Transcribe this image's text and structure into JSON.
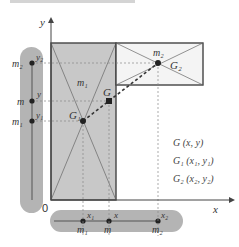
{
  "diagram": {
    "axes": {
      "x_label": "x",
      "y_label": "y",
      "origin_label": "0"
    },
    "bodies": [
      {
        "id": "body1",
        "mass_label": "m₁",
        "fill": "#c8c8c8",
        "centroid_label": "G₁"
      },
      {
        "id": "body2",
        "mass_label": "m₂",
        "fill": "#f4f4f4",
        "centroid_label": "G₂"
      }
    ],
    "combined_centroid_label": "G",
    "y_projection": {
      "points": [
        {
          "mass": "m₂",
          "coord": "y₂"
        },
        {
          "mass": "m",
          "coord": "y"
        },
        {
          "mass": "m₁",
          "coord": "y₁"
        }
      ]
    },
    "x_projection": {
      "points": [
        {
          "mass": "m₁",
          "coord": "x₁"
        },
        {
          "mass": "m",
          "coord": "x"
        },
        {
          "mass": "m₂",
          "coord": "x₂"
        }
      ]
    },
    "legend": [
      "G (x,  y)",
      "G₁ (x₁, y₁)",
      "G₂ (x₂, y₂)"
    ],
    "colors": {
      "capsule": "#b4b4b4",
      "body1": "#c8c8c8",
      "body2": "#f4f4f4",
      "outline": "#444444",
      "point": "#222222"
    }
  }
}
